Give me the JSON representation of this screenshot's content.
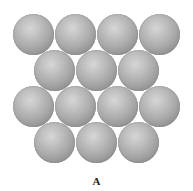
{
  "figure": {
    "label": "A",
    "sphere_color": "#a8a8a8",
    "rows": [
      {
        "count": 4,
        "offset": false
      },
      {
        "count": 3,
        "offset": true
      },
      {
        "count": 4,
        "offset": false
      },
      {
        "count": 3,
        "offset": true
      }
    ]
  }
}
